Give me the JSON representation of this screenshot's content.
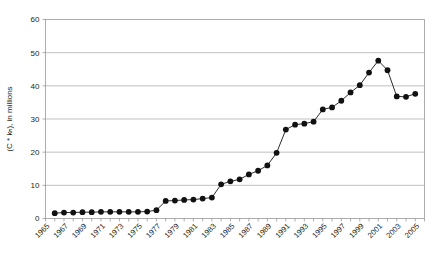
{
  "chart_data": {
    "type": "line",
    "title": "",
    "xlabel": "",
    "ylabel": "(C * kₕ), in millions",
    "xlim": [
      1965,
      2006
    ],
    "ylim": [
      0,
      60
    ],
    "ytick_values": [
      0,
      10,
      20,
      30,
      40,
      50,
      60
    ],
    "ytick_labels": [
      "0",
      "10",
      "20",
      "30",
      "40",
      "50",
      "60"
    ],
    "xtick_labels": [
      "1965",
      "1967",
      "1969",
      "1971",
      "1973",
      "1975",
      "1977",
      "1979",
      "1981",
      "1983",
      "1985",
      "1987",
      "1989",
      "1991",
      "1993",
      "1995",
      "1997",
      "1999",
      "2001",
      "2003",
      "2005"
    ],
    "grid": "horizontal",
    "legend": "none",
    "marker": "filled-circle",
    "line_color": "#151515",
    "marker_color": "#111111",
    "grid_color": "#a6a6a6",
    "x": [
      1966,
      1967,
      1968,
      1969,
      1970,
      1971,
      1972,
      1973,
      1974,
      1975,
      1976,
      1977,
      1978,
      1979,
      1980,
      1981,
      1982,
      1983,
      1984,
      1985,
      1986,
      1987,
      1988,
      1989,
      1990,
      1991,
      1992,
      1993,
      1994,
      1995,
      1996,
      1997,
      1998,
      1999,
      2000,
      2001,
      2002,
      2003,
      2004,
      2005
    ],
    "values": [
      1.6,
      1.8,
      1.8,
      1.9,
      1.9,
      2.0,
      2.0,
      2.0,
      2.0,
      2.0,
      2.1,
      2.5,
      5.3,
      5.4,
      5.6,
      5.7,
      6.0,
      6.3,
      10.3,
      11.2,
      11.8,
      13.3,
      14.4,
      16.0,
      19.8,
      26.8,
      28.3,
      28.6,
      29.2,
      32.9,
      33.5,
      35.5,
      38.0,
      40.2,
      44.0,
      47.6,
      44.7,
      36.8,
      36.7,
      37.6
    ]
  }
}
